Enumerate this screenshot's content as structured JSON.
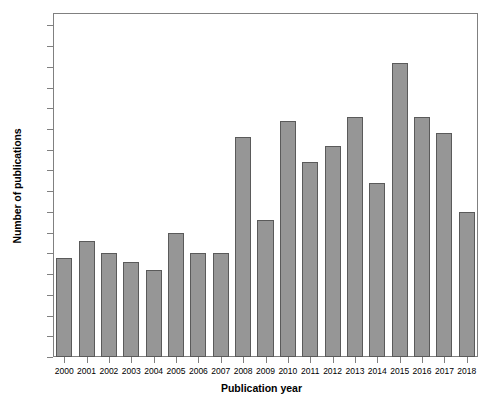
{
  "chart_data": {
    "type": "bar",
    "title": "",
    "xlabel": "Publication year",
    "ylabel": "Number of publications",
    "categories": [
      "2000",
      "2001",
      "2002",
      "2003",
      "2004",
      "2005",
      "2006",
      "2007",
      "2008",
      "2009",
      "2010",
      "2011",
      "2012",
      "2013",
      "2014",
      "2015",
      "2016",
      "2017",
      "2018"
    ],
    "values": [
      24,
      28,
      25,
      23,
      21,
      30,
      25,
      25,
      53,
      33,
      57,
      47,
      51,
      58,
      42,
      71,
      58,
      54,
      35
    ],
    "ylim": [
      0,
      83
    ],
    "yticks": [
      0,
      5,
      10,
      15,
      20,
      25,
      30,
      35,
      40,
      45,
      50,
      55,
      60,
      65,
      70,
      75,
      80
    ],
    "ytick_labels": [
      "0",
      "5",
      "10",
      "15",
      "20",
      "25",
      "30",
      "35",
      "40",
      "45",
      "50",
      "55",
      "60",
      "65",
      "70",
      "75",
      "80"
    ],
    "grid": false,
    "legend": null,
    "bar_color": "#969696",
    "bar_edge_color": "#5a5a5a",
    "axis_color": "#808080",
    "background": "#ffffff"
  }
}
